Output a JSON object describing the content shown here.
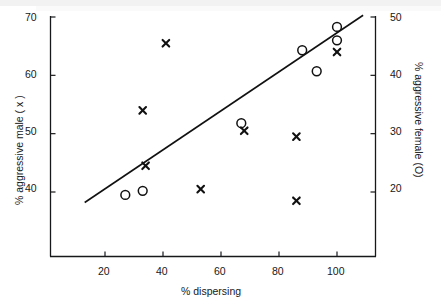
{
  "chart_data": {
    "type": "scatter",
    "title": "",
    "xlabel": "% dispersing",
    "ylabel_left": "% aggressive male ( x )",
    "ylabel_right": "% aggressive female (O)",
    "xlim": [
      6,
      114
    ],
    "ylim_left": [
      34.5,
      71
    ],
    "ylim_right": [
      16.8,
      51
    ],
    "xticks": [
      20,
      40,
      60,
      80,
      100
    ],
    "xtick_labels": [
      "20",
      "40",
      "60",
      "80",
      "100"
    ],
    "yticks_left": [
      40,
      50,
      60,
      70
    ],
    "ytick_labels_left": [
      "40",
      "50",
      "60",
      "70"
    ],
    "yticks_right": [
      20,
      30,
      40,
      50
    ],
    "ytick_labels_right": [
      "20",
      "30",
      "40",
      "50"
    ],
    "grid": false,
    "legend": "none",
    "series": [
      {
        "name": "% aggressive male ( x )",
        "marker": "x",
        "axis": "left",
        "points": [
          {
            "x": 33,
            "y": 54.0
          },
          {
            "x": 34,
            "y": 44.5
          },
          {
            "x": 41,
            "y": 65.5
          },
          {
            "x": 53,
            "y": 40.5
          },
          {
            "x": 68,
            "y": 50.5
          },
          {
            "x": 86,
            "y": 49.5
          },
          {
            "x": 86,
            "y": 38.5
          },
          {
            "x": 100,
            "y": 64.0
          }
        ]
      },
      {
        "name": "% aggressive female (O)",
        "marker": "o",
        "axis": "right",
        "points": [
          {
            "x": 27,
            "y_left": 39.5,
            "y": 19.5
          },
          {
            "x": 33,
            "y_left": 40.5,
            "y": 20.2
          },
          {
            "x": 67,
            "y_left": 54.0,
            "y": 31.8
          },
          {
            "x": 88,
            "y_left": 64.0,
            "y": 44.3
          },
          {
            "x": 93,
            "y_left": 61.0,
            "y": 40.7
          },
          {
            "x": 100,
            "y_left": 66.5,
            "y": 46.0
          },
          {
            "x": 100,
            "y_left": 68.5,
            "y": 48.3
          }
        ]
      }
    ],
    "trendline": {
      "x_start": 13,
      "y_start": 38.2,
      "x_end": 109,
      "y_end": 70.3
    }
  },
  "axis_color": "#17181a",
  "marker_color": "#111111"
}
